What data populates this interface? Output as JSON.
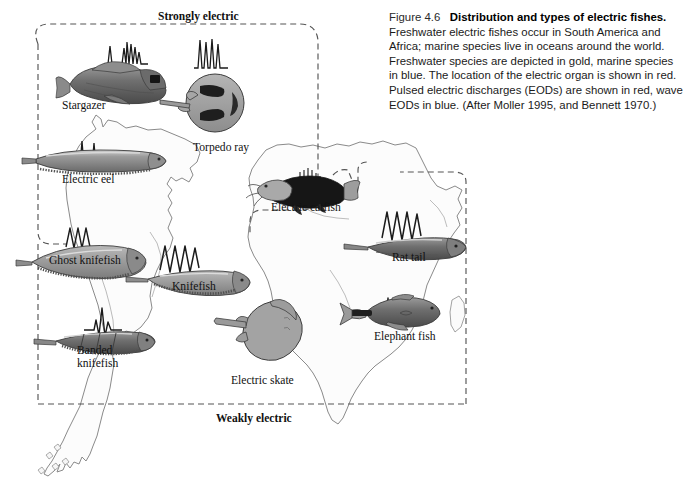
{
  "figure": {
    "number": "Figure 4.6",
    "title": "Distribution and types of electric fishes.",
    "body": "Freshwater electric fishes occur in South America and Africa; marine species live in oceans around the world. Freshwater species are depicted in gold, marine species in blue. The location of the electric organ is shown in red. Pulsed electric discharges (EODs) are shown in red, wave EODs in blue. (After Moller 1995, and Bennett 1970.)"
  },
  "zones": {
    "strong": "Strongly electric",
    "weak": "Weakly electric"
  },
  "species": [
    {
      "id": "stargazer",
      "label": "Stargazer",
      "habitat": "marine",
      "eod": "pulse",
      "zone": "strongly-electric",
      "label_x": 62,
      "label_y": 100
    },
    {
      "id": "torpedo-ray",
      "label": "Torpedo ray",
      "habitat": "marine",
      "eod": "pulse",
      "zone": "strongly-electric",
      "label_x": 193,
      "label_y": 142
    },
    {
      "id": "electric-eel",
      "label": "Electric eel",
      "habitat": "freshwater",
      "eod": "pulse",
      "zone": "strongly-electric",
      "label_x": 62,
      "label_y": 174
    },
    {
      "id": "electric-catfish",
      "label": "Electric catfish",
      "habitat": "freshwater",
      "eod": "pulse",
      "zone": "strongly-electric",
      "label_x": 271,
      "label_y": 202
    },
    {
      "id": "ghost-knifefish",
      "label": "Ghost knifefish",
      "habitat": "freshwater",
      "eod": "wave",
      "zone": "weakly-electric",
      "label_x": 49,
      "label_y": 255
    },
    {
      "id": "knifefish",
      "label": "Knifefish",
      "habitat": "freshwater",
      "eod": "wave",
      "zone": "weakly-electric",
      "label_x": 172,
      "label_y": 281
    },
    {
      "id": "rat-tail",
      "label": "Rat tail",
      "habitat": "marine",
      "eod": "wave",
      "zone": "weakly-electric",
      "label_x": 392,
      "label_y": 252
    },
    {
      "id": "banded-knifefish",
      "label": "Banded knifefish",
      "habitat": "freshwater",
      "eod": "pulse",
      "zone": "weakly-electric",
      "label_x": 77,
      "label_y": 345
    },
    {
      "id": "elephant-fish",
      "label": "Elephant fish",
      "habitat": "freshwater",
      "eod": "pulse",
      "zone": "weakly-electric",
      "label_x": 374,
      "label_y": 331
    },
    {
      "id": "electric-skate",
      "label": "Electric skate",
      "habitat": "marine",
      "eod": "pulse",
      "zone": "weakly-electric",
      "label_x": 231,
      "label_y": 375
    }
  ],
  "colors": {
    "background": "#ffffff",
    "map_outline": "#808080",
    "map_fill": "#fbfbfb",
    "dashed_boundary": "#555555",
    "fish_body_light": "#a8a8a8",
    "fish_body_mid": "#8e8e8e",
    "fish_body_dark": "#2b2b2b",
    "waveform": "#1a1a1a",
    "text": "#111111"
  }
}
